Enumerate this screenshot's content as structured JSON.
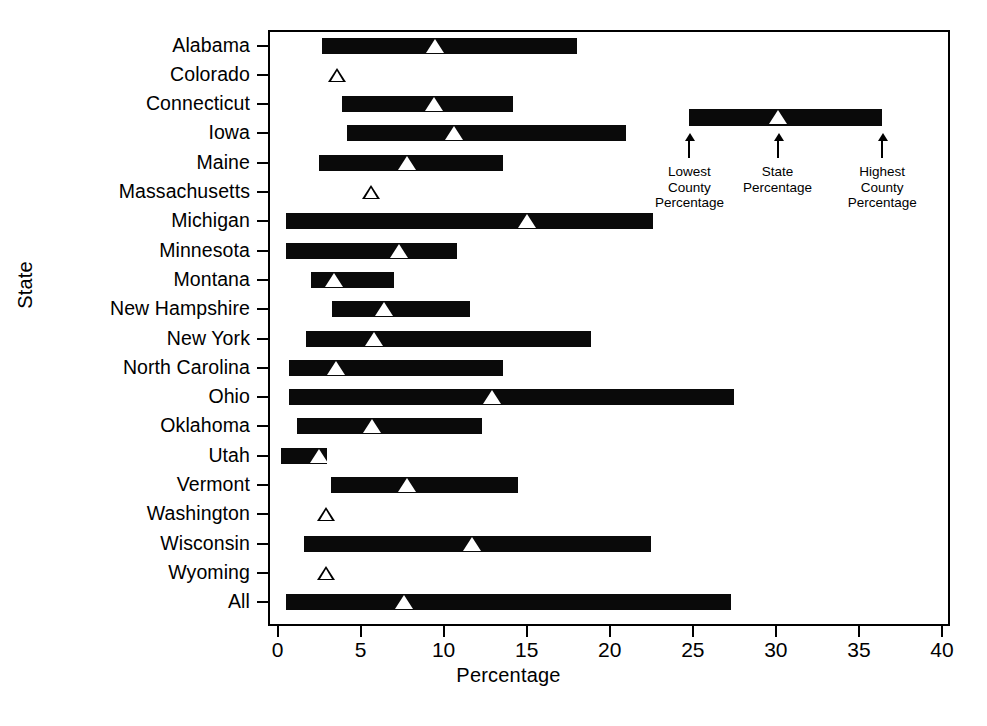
{
  "chart_data": {
    "type": "bar",
    "title": "",
    "xlabel": "Percentage",
    "ylabel": "State",
    "xlim": [
      0,
      40
    ],
    "xticks": [
      0,
      5,
      10,
      15,
      20,
      25,
      30,
      35,
      40
    ],
    "grid": false,
    "legend_position": "inside-upper-right",
    "series_description": "Range bars show lowest to highest county percentage per state; white triangle marks the state percentage. States with a single open triangle have only a state percentage shown.",
    "categories": [
      "Alabama",
      "Colorado",
      "Connecticut",
      "Iowa",
      "Maine",
      "Massachusetts",
      "Michigan",
      "Minnesota",
      "Montana",
      "New Hampshire",
      "New York",
      "North Carolina",
      "Ohio",
      "Oklahoma",
      "Utah",
      "Vermont",
      "Washington",
      "Wisconsin",
      "Wyoming",
      "All"
    ],
    "rows": [
      {
        "state": "Alabama",
        "lowest": 2.7,
        "highest": 18.0,
        "state_percentage": 9.5,
        "marker": "filled"
      },
      {
        "state": "Colorado",
        "lowest": null,
        "highest": null,
        "state_percentage": 3.6,
        "marker": "open"
      },
      {
        "state": "Connecticut",
        "lowest": 3.9,
        "highest": 14.2,
        "state_percentage": 9.4,
        "marker": "filled"
      },
      {
        "state": "Iowa",
        "lowest": 4.2,
        "highest": 21.0,
        "state_percentage": 10.6,
        "marker": "filled"
      },
      {
        "state": "Maine",
        "lowest": 2.5,
        "highest": 13.6,
        "state_percentage": 7.8,
        "marker": "filled"
      },
      {
        "state": "Massachusetts",
        "lowest": null,
        "highest": null,
        "state_percentage": 5.6,
        "marker": "open"
      },
      {
        "state": "Michigan",
        "lowest": 0.5,
        "highest": 22.6,
        "state_percentage": 15.0,
        "marker": "filled"
      },
      {
        "state": "Minnesota",
        "lowest": 0.5,
        "highest": 10.8,
        "state_percentage": 7.3,
        "marker": "filled"
      },
      {
        "state": "Montana",
        "lowest": 2.0,
        "highest": 7.0,
        "state_percentage": 3.4,
        "marker": "filled"
      },
      {
        "state": "New Hampshire",
        "lowest": 3.3,
        "highest": 11.6,
        "state_percentage": 6.4,
        "marker": "filled"
      },
      {
        "state": "New York",
        "lowest": 1.7,
        "highest": 18.9,
        "state_percentage": 5.8,
        "marker": "filled"
      },
      {
        "state": "North Carolina",
        "lowest": 0.7,
        "highest": 13.6,
        "state_percentage": 3.5,
        "marker": "filled"
      },
      {
        "state": "Ohio",
        "lowest": 0.7,
        "highest": 27.5,
        "state_percentage": 12.9,
        "marker": "filled"
      },
      {
        "state": "Oklahoma",
        "lowest": 1.2,
        "highest": 12.3,
        "state_percentage": 5.7,
        "marker": "filled"
      },
      {
        "state": "Utah",
        "lowest": 0.2,
        "highest": 3.0,
        "state_percentage": 2.5,
        "marker": "filled"
      },
      {
        "state": "Vermont",
        "lowest": 3.2,
        "highest": 14.5,
        "state_percentage": 7.8,
        "marker": "filled"
      },
      {
        "state": "Washington",
        "lowest": null,
        "highest": null,
        "state_percentage": 2.9,
        "marker": "open"
      },
      {
        "state": "Wisconsin",
        "lowest": 1.6,
        "highest": 22.5,
        "state_percentage": 11.7,
        "marker": "filled"
      },
      {
        "state": "Wyoming",
        "lowest": null,
        "highest": null,
        "state_percentage": 2.9,
        "marker": "open"
      },
      {
        "state": "All",
        "lowest": 0.5,
        "highest": 27.3,
        "state_percentage": 7.6,
        "marker": "filled"
      }
    ],
    "legend": {
      "bar_from": 24.8,
      "bar_to": 36.4,
      "marker_at": 30.1,
      "annotations": [
        {
          "label": "Lowest\nCounty\nPercentage",
          "line1": "Lowest",
          "line2": "County",
          "line3": "Percentage",
          "at": 24.8
        },
        {
          "label": "State\nPercentage",
          "line1": "State",
          "line2": "Percentage",
          "line3": "",
          "at": 30.1
        },
        {
          "label": "Highest\nCounty\nPercentage",
          "line1": "Highest",
          "line2": "County",
          "line3": "Percentage",
          "at": 36.4
        }
      ]
    }
  },
  "colors": {
    "bar": "#0a0a0a",
    "marker_fill": "#ffffff",
    "axis": "#000000",
    "background": "#ffffff"
  }
}
